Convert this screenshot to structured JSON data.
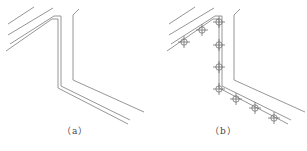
{
  "figure": {
    "panels": [
      {
        "id": "a",
        "caption": "（a）",
        "description": "Pipe run along wall corner, without supports"
      },
      {
        "id": "b",
        "caption": "（b）",
        "description": "Pipe run along wall corner, with support/hanger markers",
        "markers": [
          {
            "x": 184,
            "y": 42
          },
          {
            "x": 202,
            "y": 30
          },
          {
            "x": 219,
            "y": 22
          },
          {
            "x": 219,
            "y": 45
          },
          {
            "x": 219,
            "y": 67
          },
          {
            "x": 219,
            "y": 89
          },
          {
            "x": 236,
            "y": 99
          },
          {
            "x": 255,
            "y": 108
          },
          {
            "x": 274,
            "y": 118
          }
        ]
      }
    ],
    "colors": {
      "line": "#8a8a8a",
      "marker": "#6f6f6f",
      "background": "#ffffff"
    }
  }
}
